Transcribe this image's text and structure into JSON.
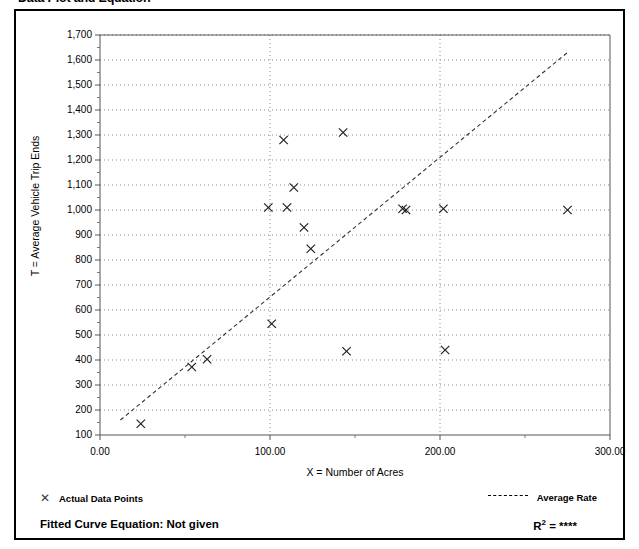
{
  "page": {
    "title": "Data Plot and Equation"
  },
  "legend": {
    "points_label": "Actual Data Points",
    "points_marker": "x-marker-icon",
    "rate_label": "Average Rate",
    "rate_marker": "dashed-line-icon"
  },
  "footer": {
    "fitted_curve_label": "Fitted Curve Equation:  Not given",
    "r_squared_prefix": "R",
    "r_squared_exponent": "2",
    "r_squared_value": " = ****"
  },
  "chart_data": {
    "type": "scatter",
    "title": "Data Plot and Equation",
    "xlabel": "X = Number of Acres",
    "ylabel": "T = Average Vehicle Trip Ends",
    "xlim": [
      0,
      300
    ],
    "ylim": [
      100,
      1700
    ],
    "xticks": [
      0,
      100,
      200,
      300
    ],
    "xtick_labels": [
      "0.00",
      "100.00",
      "200.00",
      "300.00"
    ],
    "yticks": [
      100,
      200,
      300,
      400,
      500,
      600,
      700,
      800,
      900,
      1000,
      1100,
      1200,
      1300,
      1400,
      1500,
      1600,
      1700
    ],
    "ytick_labels": [
      "100",
      "200",
      "300",
      "400",
      "500",
      "600",
      "700",
      "800",
      "900",
      "1,000",
      "1,100",
      "1,200",
      "1,300",
      "1,400",
      "1,500",
      "1,600",
      "1,700"
    ],
    "grid": true,
    "grid_style": "dotted",
    "legend_position": "below-plot",
    "series": [
      {
        "name": "Actual Data Points",
        "marker": "x",
        "points": [
          {
            "x": 24,
            "y": 145
          },
          {
            "x": 54,
            "y": 372
          },
          {
            "x": 63,
            "y": 403
          },
          {
            "x": 99,
            "y": 1010
          },
          {
            "x": 101,
            "y": 545
          },
          {
            "x": 108,
            "y": 1280
          },
          {
            "x": 110,
            "y": 1010
          },
          {
            "x": 114,
            "y": 1090
          },
          {
            "x": 120,
            "y": 930
          },
          {
            "x": 124,
            "y": 845
          },
          {
            "x": 143,
            "y": 1310
          },
          {
            "x": 145,
            "y": 435
          },
          {
            "x": 178,
            "y": 1005
          },
          {
            "x": 180,
            "y": 1000
          },
          {
            "x": 202,
            "y": 1005
          },
          {
            "x": 203,
            "y": 440
          },
          {
            "x": 275,
            "y": 1000
          }
        ]
      },
      {
        "name": "Average Rate",
        "type": "line",
        "style": "dashed",
        "endpoints": [
          {
            "x": 12,
            "y": 160
          },
          {
            "x": 275,
            "y": 1630
          }
        ]
      }
    ]
  }
}
